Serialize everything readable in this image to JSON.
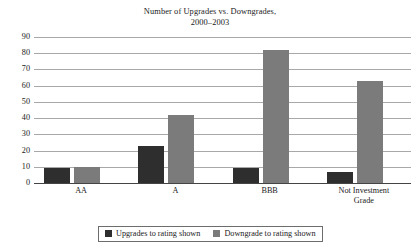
{
  "chart_data": {
    "type": "bar",
    "title": "Number of Upgrades vs. Downgrades,",
    "subtitle": "2000–2003",
    "xlabel": "",
    "ylabel": "",
    "ylim": [
      0,
      90
    ],
    "ytick_step": 10,
    "yticks": [
      90,
      80,
      70,
      60,
      50,
      40,
      30,
      20,
      10,
      0
    ],
    "grid": true,
    "legend_position": "bottom-center",
    "categories": [
      "AA",
      "A",
      "BBB",
      "Not Investment Grade"
    ],
    "category_lines": [
      [
        "AA"
      ],
      [
        "A"
      ],
      [
        "BBB"
      ],
      [
        "Not Investment",
        "Grade"
      ]
    ],
    "series": [
      {
        "name": "Upgrades to rating shown",
        "color": "#2e2e2e",
        "values": [
          9,
          23,
          9,
          7
        ]
      },
      {
        "name": "Downgrade to rating shown",
        "color": "#7b7b7b",
        "values": [
          10,
          42,
          82,
          63
        ]
      }
    ]
  },
  "legend": {
    "items": [
      {
        "label": "Upgrades to rating shown",
        "swatch": "upgrades"
      },
      {
        "label": "Downgrade to rating shown",
        "swatch": "downgrades"
      }
    ]
  }
}
